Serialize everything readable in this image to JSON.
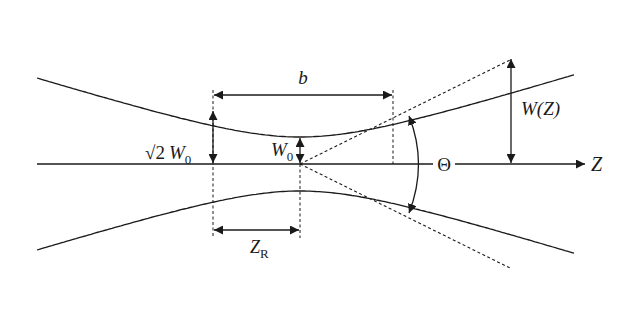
{
  "diagram": {
    "colors": {
      "stroke": "#1a1a1a",
      "background": "#ffffff"
    },
    "labels": {
      "axis": "Z",
      "beam_width": "W(Z)",
      "divergence_angle": "Θ",
      "waist": "W",
      "waist_sub": "0",
      "sqrt2_radical": "√2",
      "sqrt2_waist": "W",
      "sqrt2_waist_sub": "0",
      "confocal_parameter": "b",
      "rayleigh_range": "Z",
      "rayleigh_range_sub": "R"
    }
  }
}
